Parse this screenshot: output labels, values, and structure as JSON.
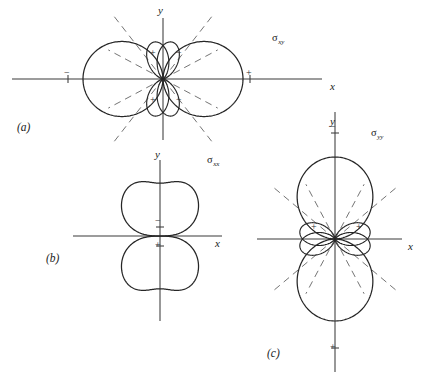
{
  "figure": {
    "background": "#ffffff",
    "ink_color": "#262626",
    "axis_color": "#3b3b3b",
    "node_line_color": "#6d6d6d",
    "width": 423,
    "height": 383
  },
  "panels": [
    {
      "key": "a",
      "panel_label": "(a)",
      "panel_label_pos": [
        17,
        131
      ],
      "curve_label": "σ",
      "curve_subscript": "xy",
      "curve_label_pos": [
        272,
        41
      ],
      "origin": [
        163,
        79
      ],
      "x_axis": {
        "label": "x",
        "label_pos": [
          330,
          90
        ],
        "x_start": 12,
        "x_end": 322,
        "y": 79
      },
      "y_axis": {
        "label": "y",
        "label_pos": [
          158,
          14
        ],
        "y_start": 18,
        "y_end": 140,
        "x": 163
      },
      "axis_ticks": [
        {
          "name": "minus-tick-left",
          "x": 68,
          "y": 79,
          "sign": "−",
          "sign_pos": [
            64,
            76
          ]
        },
        {
          "name": "plus-tick-right",
          "x": 250,
          "y": 79,
          "sign": "+",
          "sign_pos": [
            246,
            76
          ]
        }
      ],
      "major_lobes": [
        {
          "name": "major-lobe-right",
          "direction_deg": 0,
          "radius": 80,
          "width_factor": 0.46,
          "sign": ""
        },
        {
          "name": "major-lobe-left",
          "direction_deg": 180,
          "radius": 80,
          "width_factor": 0.46,
          "sign": ""
        }
      ],
      "minor_lobes": [
        {
          "name": "minor-lobe-upper-left",
          "direction_deg": 104,
          "radius": 38,
          "width_factor": 0.13,
          "sign": "+",
          "sign_pos": [
            150,
            56
          ]
        },
        {
          "name": "minor-lobe-upper-right",
          "direction_deg": 76,
          "radius": 38,
          "width_factor": 0.13,
          "sign": "−",
          "sign_pos": [
            176,
            56
          ]
        },
        {
          "name": "minor-lobe-lower-left",
          "direction_deg": 256,
          "radius": 38,
          "width_factor": 0.13,
          "sign": "+",
          "sign_pos": [
            150,
            103
          ]
        },
        {
          "name": "minor-lobe-lower-right",
          "direction_deg": 284,
          "radius": 38,
          "width_factor": 0.13,
          "sign": "−",
          "sign_pos": [
            176,
            103
          ]
        }
      ],
      "node_lines": [
        {
          "name": "node-line-ne",
          "angle_deg": 52,
          "length": 80
        },
        {
          "name": "node-line-nw",
          "angle_deg": 128,
          "length": 80
        },
        {
          "name": "node-line-sw",
          "angle_deg": 232,
          "length": 80
        },
        {
          "name": "node-line-se",
          "angle_deg": 308,
          "length": 80
        },
        {
          "name": "node-line-ne-inner",
          "angle_deg": 28,
          "length": 62
        },
        {
          "name": "node-line-nw-inner",
          "angle_deg": 152,
          "length": 62
        },
        {
          "name": "node-line-sw-inner",
          "angle_deg": 208,
          "length": 62
        },
        {
          "name": "node-line-se-inner",
          "angle_deg": 332,
          "length": 62
        }
      ]
    },
    {
      "key": "b",
      "panel_label": "(b)",
      "panel_label_pos": [
        46,
        262
      ],
      "curve_label": "σ",
      "curve_subscript": "xx",
      "curve_label_pos": [
        207,
        163
      ],
      "origin": [
        160,
        236
      ],
      "x_axis": {
        "label": "x",
        "label_pos": [
          215,
          247
        ],
        "x_start": 73,
        "x_end": 222,
        "y": 236
      },
      "y_axis": {
        "label": "y",
        "label_pos": [
          155,
          158
        ],
        "y_start": 160,
        "y_end": 321,
        "x": 160
      },
      "axis_ticks": [
        {
          "name": "minus-tick-up",
          "x": 160,
          "y": 227,
          "sign": "−",
          "sign_pos": [
            155,
            224
          ]
        },
        {
          "name": "plus-tick-down",
          "x": 160,
          "y": 246,
          "sign": "+",
          "sign_pos": [
            155,
            248
          ]
        }
      ],
      "major_lobes": [
        {
          "name": "butterfly-lobe-upper",
          "direction_deg": 90,
          "radius": 66,
          "width_factor": 0.95,
          "sign": "",
          "dimple": 0.2
        },
        {
          "name": "butterfly-lobe-lower",
          "direction_deg": 270,
          "radius": 66,
          "width_factor": 0.95,
          "sign": "",
          "dimple": 0.2
        }
      ],
      "minor_lobes": [],
      "node_lines": []
    },
    {
      "key": "c",
      "panel_label": "(c)",
      "panel_label_pos": [
        267,
        357
      ],
      "curve_label": "σ",
      "curve_subscript": "yy",
      "curve_label_pos": [
        371,
        136
      ],
      "origin": [
        335,
        239
      ],
      "x_axis": {
        "label": "x",
        "label_pos": [
          408,
          250
        ],
        "x_start": 257,
        "x_end": 402,
        "y": 239
      },
      "y_axis": {
        "label": "y",
        "label_pos": [
          330,
          125
        ],
        "y_start": 112,
        "y_end": 372,
        "x": 335
      },
      "axis_ticks": [
        {
          "name": "minus-tick-up",
          "x": 335,
          "y": 133,
          "sign": "−",
          "sign_pos": [
            330,
            130
          ]
        },
        {
          "name": "plus-tick-down",
          "x": 335,
          "y": 348,
          "sign": "+",
          "sign_pos": [
            330,
            350
          ]
        }
      ],
      "major_lobes": [
        {
          "name": "major-lobe-up",
          "direction_deg": 90,
          "radius": 82,
          "width_factor": 0.44,
          "sign": ""
        },
        {
          "name": "major-lobe-down",
          "direction_deg": 270,
          "radius": 82,
          "width_factor": 0.44,
          "sign": ""
        }
      ],
      "minor_lobes": [
        {
          "name": "minor-lobe-left-upper",
          "direction_deg": 166,
          "radius": 36,
          "width_factor": 0.16,
          "sign": "+",
          "sign_pos": [
            311,
            230
          ]
        },
        {
          "name": "minor-lobe-right-upper",
          "direction_deg": 14,
          "radius": 36,
          "width_factor": 0.16,
          "sign": "+",
          "sign_pos": [
            356,
            230
          ]
        },
        {
          "name": "minor-lobe-left-lower",
          "direction_deg": 194,
          "radius": 36,
          "width_factor": 0.16,
          "sign": "",
          "sign_pos": [
            311,
            252
          ]
        },
        {
          "name": "minor-lobe-right-lower",
          "direction_deg": 346,
          "radius": 36,
          "width_factor": 0.16,
          "sign": "",
          "sign_pos": [
            356,
            252
          ]
        }
      ],
      "node_lines": [
        {
          "name": "node-line-ne",
          "angle_deg": 40,
          "length": 82
        },
        {
          "name": "node-line-nw",
          "angle_deg": 140,
          "length": 82
        },
        {
          "name": "node-line-sw",
          "angle_deg": 220,
          "length": 82
        },
        {
          "name": "node-line-se",
          "angle_deg": 320,
          "length": 82
        },
        {
          "name": "node-line-ne-inner",
          "angle_deg": 62,
          "length": 62
        },
        {
          "name": "node-line-nw-inner",
          "angle_deg": 118,
          "length": 62
        },
        {
          "name": "node-line-sw-inner",
          "angle_deg": 242,
          "length": 62
        },
        {
          "name": "node-line-se-inner",
          "angle_deg": 298,
          "length": 62
        }
      ]
    }
  ],
  "chart_data": {
    "type": "line",
    "title": "",
    "series": [
      {
        "name": "σxy",
        "panel": "(a)",
        "lobes": 2,
        "minor_lobes": 4,
        "major_axis": "x"
      },
      {
        "name": "σxx",
        "panel": "(b)",
        "lobes": 2,
        "minor_lobes": 0,
        "major_axis": "y"
      },
      {
        "name": "σyy",
        "panel": "(c)",
        "lobes": 2,
        "minor_lobes": 4,
        "major_axis": "y"
      }
    ],
    "xlabel": "x",
    "ylabel": "y",
    "legend": [
      "σxy",
      "σxx",
      "σyy"
    ]
  }
}
